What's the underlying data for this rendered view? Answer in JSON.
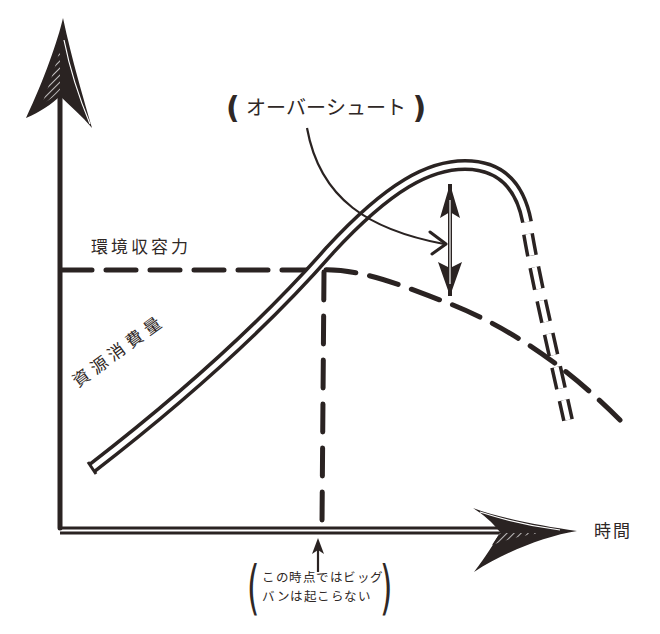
{
  "diagram": {
    "type": "hand-drawn concept diagram: overshoot and collapse",
    "axes": {
      "x_label": "時間",
      "y_label": ""
    },
    "labels": {
      "overshoot": "オーバーシュート",
      "overshoot_open_paren": "(",
      "overshoot_close_paren": ")",
      "carrying_capacity": "環境収容力",
      "resource_consumption": "資源消費量",
      "time": "時間"
    },
    "note": {
      "line1": "この時点ではビッグ",
      "line2": "バンは起こらない",
      "open_paren": "(",
      "close_paren": ")"
    },
    "elements": [
      {
        "name": "resource-consumption-curve",
        "style": "double line, solid then dashed after peak",
        "description": "rises steadily, overshoots capacity, peaks, then collapses sharply"
      },
      {
        "name": "carrying-capacity-line",
        "style": "thick dashed",
        "description": "horizontal, then declines after consumption exceeds it"
      },
      {
        "name": "crossing-marker-line",
        "style": "thick dashed vertical",
        "description": "drops from crossing point to time axis"
      },
      {
        "name": "overshoot-gap-arrow",
        "style": "double-headed vertical arrow",
        "description": "gap between consumption peak and capacity"
      },
      {
        "name": "note-pointer-arrow",
        "style": "single arrow up",
        "description": "points up to the crossing time on the x-axis"
      }
    ],
    "colors": {
      "ink": "#2a2322",
      "background": "#ffffff"
    }
  }
}
